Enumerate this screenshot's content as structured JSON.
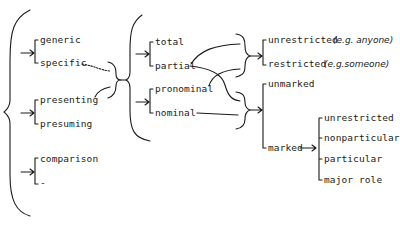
{
  "diagram": {
    "type": "system-network",
    "colors": {
      "ink": "#1a1a1a",
      "background": "#ffffff"
    },
    "systems": {
      "genericity": {
        "options": [
          "generic",
          "specific"
        ]
      },
      "orientation": {
        "options": [
          "presenting",
          "presuming"
        ]
      },
      "comparison": {
        "options": [
          "comparison",
          "-"
        ]
      },
      "totality": {
        "options": [
          "total",
          "partial"
        ]
      },
      "nominality": {
        "options": [
          "pronominal",
          "nominal"
        ]
      },
      "restriction": {
        "options": [
          "unrestricted",
          "restricted"
        ],
        "examples": [
          "(e.g. anyone)",
          "(e.g.someone)"
        ]
      },
      "markedness": {
        "options": [
          "unmarked",
          "marked"
        ]
      },
      "marked_sub": {
        "options": [
          "unrestricted",
          "nonparticular",
          "particular",
          "major role"
        ]
      }
    }
  }
}
